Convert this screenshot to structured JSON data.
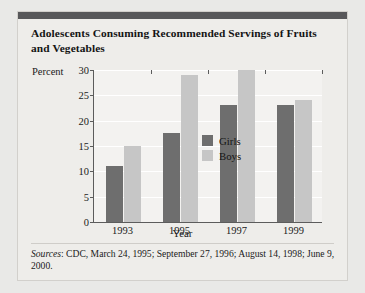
{
  "figure": {
    "title": "Adolescents Consuming Recommended Servings of Fruits and Vegetables",
    "source_prefix": "Sources",
    "source_text": ": CDC, March 24, 1995; September 27, 1996; August 14, 1998; June 9, 2000."
  },
  "colors": {
    "girls": "#6e6e6e",
    "boys": "#c6c6c6",
    "panel_background": "#eeedea",
    "plot_background": "#f3f2f0",
    "header_bar": "#58585a",
    "axis": "#5c5c5c",
    "gridline": "#ffffff"
  },
  "chart_data": {
    "type": "bar",
    "title": "Adolescents Consuming Recommended Servings of Fruits and Vegetables",
    "xlabel": "Year",
    "ylabel": "Percent",
    "categories": [
      "1993",
      "1995",
      "1997",
      "1999"
    ],
    "series": [
      {
        "name": "Girls",
        "values": [
          11,
          17.5,
          23,
          23
        ]
      },
      {
        "name": "Boys",
        "values": [
          15,
          29,
          30,
          24
        ]
      }
    ],
    "ylim": [
      0,
      30
    ],
    "ytick_values": [
      0,
      5,
      10,
      15,
      20,
      25,
      30
    ],
    "ytick_labels": [
      "0",
      "5",
      "10",
      "15",
      "20",
      "25",
      "30"
    ],
    "grid": true,
    "legend_position": "top-left-inside"
  }
}
